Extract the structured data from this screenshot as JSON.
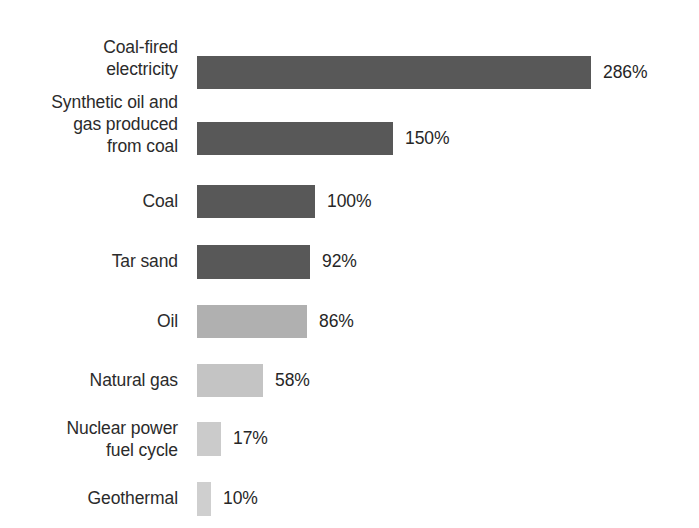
{
  "chart_data": {
    "type": "bar",
    "orientation": "horizontal",
    "title": "",
    "subtitle": "",
    "xlabel": "",
    "ylabel": "",
    "grid": false,
    "legend": null,
    "axis_visible": false,
    "value_unit": "%",
    "baseline_category": "Coal",
    "baseline_value": 100,
    "categories": [
      "Coal-fired\nelectricity",
      "Synthetic oil and\ngas produced\nfrom coal",
      "Coal",
      "Tar sand",
      "Oil",
      "Natural gas",
      "Nuclear power\nfuel cycle",
      "Geothermal"
    ],
    "values": [
      286,
      150,
      100,
      92,
      86,
      58,
      17,
      10
    ],
    "value_labels": [
      "286%",
      "150%",
      "100%",
      "92%",
      "86%",
      "58%",
      "17%",
      "10%"
    ],
    "bar_colors": [
      "#585858",
      "#585858",
      "#585858",
      "#585858",
      "#b0b0b0",
      "#c4c4c4",
      "#cbcbcb",
      "#cfcfcf"
    ],
    "bars": [
      {
        "label": "Coal-fired\nelectricity",
        "value": 286,
        "value_label": "286%",
        "color": "#585858",
        "top": 56,
        "height": 33,
        "width": 394,
        "label_top": 36
      },
      {
        "label": "Synthetic oil and\ngas produced\nfrom coal",
        "value": 150,
        "value_label": "150%",
        "color": "#585858",
        "top": 122,
        "height": 33,
        "width": 196,
        "label_top": 91
      },
      {
        "label": "Coal",
        "value": 100,
        "value_label": "100%",
        "color": "#585858",
        "top": 185,
        "height": 33,
        "width": 118,
        "label_top": 190
      },
      {
        "label": "Tar sand",
        "value": 92,
        "value_label": "92%",
        "color": "#585858",
        "top": 245,
        "height": 34,
        "width": 113,
        "label_top": 250
      },
      {
        "label": "Oil",
        "value": 86,
        "value_label": "86%",
        "color": "#b0b0b0",
        "top": 305,
        "height": 33,
        "width": 110,
        "label_top": 310
      },
      {
        "label": "Natural gas",
        "value": 58,
        "value_label": "58%",
        "color": "#c4c4c4",
        "top": 364,
        "height": 33,
        "width": 66,
        "label_top": 369
      },
      {
        "label": "Nuclear power\nfuel cycle",
        "value": 17,
        "value_label": "17%",
        "color": "#cbcbcb",
        "top": 422,
        "height": 34,
        "width": 24,
        "label_top": 417
      },
      {
        "label": "Geothermal",
        "value": 10,
        "value_label": "10%",
        "color": "#cfcfcf",
        "top": 482,
        "height": 34,
        "width": 14,
        "label_top": 487
      }
    ]
  }
}
